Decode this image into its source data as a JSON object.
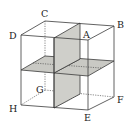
{
  "diagram": {
    "type": "cube-cross-sections",
    "vertices": [
      {
        "name": "A",
        "x": 88,
        "y": 40,
        "label_x": 84,
        "label_y": 38
      },
      {
        "name": "B",
        "x": 114,
        "y": 26,
        "label_x": 117,
        "label_y": 28
      },
      {
        "name": "C",
        "x": 45,
        "y": 21,
        "label_x": 41,
        "label_y": 17
      },
      {
        "name": "D",
        "x": 21,
        "y": 35,
        "label_x": 10,
        "label_y": 38
      },
      {
        "name": "E",
        "x": 88,
        "y": 110,
        "label_x": 85,
        "label_y": 121
      },
      {
        "name": "F",
        "x": 114,
        "y": 97,
        "label_x": 117,
        "label_y": 102
      },
      {
        "name": "G",
        "x": 45,
        "y": 90,
        "label_x": 36,
        "label_y": 92
      },
      {
        "name": "H",
        "x": 21,
        "y": 105,
        "label_x": 10,
        "label_y": 112
      }
    ],
    "labels": {
      "A": "A",
      "B": "B",
      "C": "C",
      "D": "D",
      "E": "E",
      "F": "F",
      "G": "G",
      "H": "H"
    },
    "colors": {
      "edge": "#3a3a3a",
      "plane_fill": "#c9c9c4",
      "background": "#ffffff"
    }
  }
}
